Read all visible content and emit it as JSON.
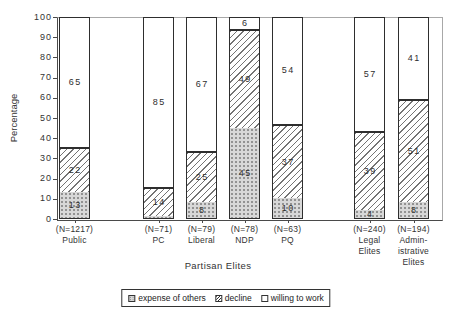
{
  "chart_data": {
    "type": "bar",
    "stacked": true,
    "percent_scale": true,
    "title": "",
    "xlabel": "Partisan Elites",
    "ylabel": "Percentage",
    "ylim": [
      0,
      100
    ],
    "yticks": [
      0,
      10,
      20,
      30,
      40,
      50,
      60,
      70,
      80,
      90,
      100
    ],
    "grid": false,
    "legend_position": "bottom",
    "label_min": 2,
    "categories": [
      {
        "lines": [
          "(N=1217)",
          "Public"
        ]
      },
      {
        "lines": [
          "(N=71)",
          "PC"
        ]
      },
      {
        "lines": [
          "(N=79)",
          "Liberal"
        ]
      },
      {
        "lines": [
          "(N=78)",
          "NDP"
        ]
      },
      {
        "lines": [
          "(N=63)",
          "PQ"
        ]
      },
      {
        "lines": [
          "(N=240)",
          "Legal",
          "Elites"
        ]
      },
      {
        "lines": [
          "(N=194)",
          "Admin-",
          "istrative",
          "Elites"
        ]
      }
    ],
    "series": [
      {
        "name": "expense of others",
        "pattern": "dotted-gray",
        "values": [
          13,
          1,
          8,
          45,
          10,
          4,
          8
        ]
      },
      {
        "name": "decline",
        "pattern": "diagonal-hatch",
        "values": [
          22,
          14,
          25,
          49,
          37,
          39,
          51
        ]
      },
      {
        "name": "willing to work",
        "pattern": "plain-white",
        "values": [
          65,
          85,
          67,
          6,
          54,
          57,
          41
        ]
      }
    ]
  },
  "colors": {
    "text": "#333333",
    "axis": "#4a4a4a",
    "frame_light": "#a8a8a8",
    "segment_gray_fill": "#d8d8d8",
    "hatch_line": "#747474",
    "background": "#ffffff"
  }
}
